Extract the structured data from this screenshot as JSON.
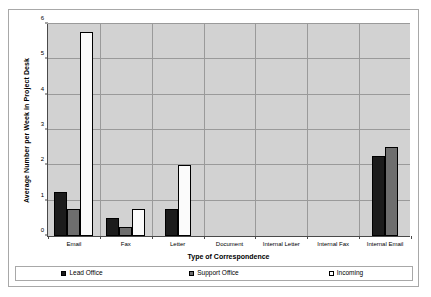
{
  "chart_data": {
    "type": "bar",
    "title": "",
    "xlabel": "Type of Correspondence",
    "ylabel": "Average Number per Week in Project Desk",
    "categories": [
      "Email",
      "Fax",
      "Letter",
      "Document",
      "Internal Letter",
      "Internal Fax",
      "Internal Email"
    ],
    "series": [
      {
        "name": "Lead Office",
        "color": "#1c1c1c",
        "values": [
          1.25,
          0.5,
          0.75,
          0,
          0,
          0,
          2.25
        ]
      },
      {
        "name": "Support Office",
        "color": "#6e6e6e",
        "values": [
          0.75,
          0.25,
          0,
          0,
          0,
          0,
          2.5
        ]
      },
      {
        "name": "Incoming",
        "color": "#ffffff",
        "values": [
          5.75,
          0.75,
          2.0,
          0,
          0,
          0,
          0
        ]
      }
    ],
    "ylim": [
      0,
      6
    ],
    "yticks": [
      0,
      1,
      2,
      3,
      4,
      5,
      6
    ],
    "ytick_labels": [
      "0",
      "1",
      "2",
      "3",
      "4",
      "5",
      "6"
    ],
    "grid": "horizontal-and-category-separators",
    "legend_position": "bottom",
    "plot_background": "#d2d2d2",
    "axis_color": "#4a4a4a",
    "gridline_color": "#9a9a9a"
  },
  "legend": {
    "entries": [
      {
        "label": "Lead Office"
      },
      {
        "label": "Support Office"
      },
      {
        "label": "Incoming"
      }
    ]
  }
}
